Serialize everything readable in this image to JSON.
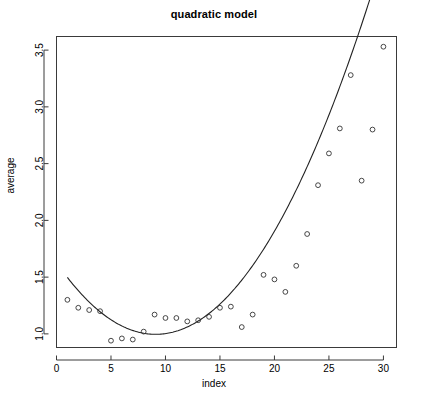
{
  "chart_data": {
    "type": "scatter",
    "title": "quadratic model",
    "xlabel": "index",
    "ylabel": "average",
    "xlim": [
      0,
      31.2
    ],
    "ylim": [
      0.88,
      3.62
    ],
    "grid": false,
    "legend": null,
    "x_ticks": [
      0,
      5,
      10,
      15,
      20,
      25,
      30
    ],
    "x_tick_labels": [
      "0",
      "5",
      "10",
      "15",
      "20",
      "25",
      "30"
    ],
    "y_ticks": [
      1.0,
      1.5,
      2.0,
      2.5,
      3.0,
      3.5
    ],
    "y_tick_labels": [
      "1.0",
      "1.5",
      "2.0",
      "2.5",
      "3.0",
      "3.5"
    ],
    "marker": "open-circle",
    "x": [
      1,
      2,
      3,
      4,
      5,
      6,
      7,
      8,
      9,
      10,
      11,
      12,
      13,
      14,
      15,
      16,
      17,
      18,
      19,
      20,
      21,
      22,
      23,
      24,
      25,
      26,
      27,
      28,
      29,
      30
    ],
    "y": [
      1.3,
      1.23,
      1.21,
      1.2,
      0.94,
      0.96,
      0.95,
      1.02,
      1.17,
      1.14,
      1.14,
      1.11,
      1.12,
      1.15,
      1.23,
      1.24,
      1.06,
      1.17,
      1.52,
      1.48,
      1.37,
      1.6,
      1.88,
      2.31,
      2.59,
      2.81,
      3.28,
      2.35,
      2.8,
      3.53
    ],
    "series": [
      {
        "name": "average",
        "type": "scatter",
        "values": [
          1.3,
          1.23,
          1.21,
          1.2,
          0.94,
          0.96,
          0.95,
          1.02,
          1.17,
          1.14,
          1.14,
          1.11,
          1.12,
          1.15,
          1.23,
          1.24,
          1.06,
          1.17,
          1.52,
          1.48,
          1.37,
          1.6,
          1.88,
          2.31,
          2.59,
          2.81,
          3.28,
          2.35,
          2.8,
          3.53
        ]
      },
      {
        "name": "quadratic fit",
        "type": "line",
        "fit": {
          "form": "quadratic",
          "intercept": 1.6285,
          "linear": -0.139,
          "quadratic": 0.00764
        }
      }
    ],
    "colors": {
      "point": "#333333",
      "curve": "#222222",
      "axis": "#3a3a3a",
      "background": "#ffffff",
      "text": "#000000"
    }
  }
}
